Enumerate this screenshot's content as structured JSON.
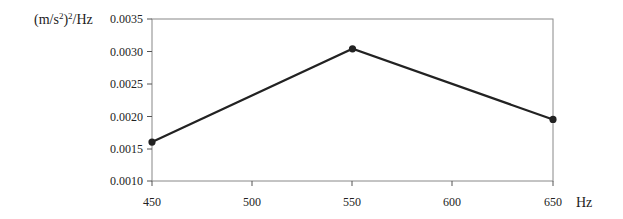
{
  "chart_data": {
    "type": "line",
    "title": "",
    "xlabel": "Hz",
    "ylabel": "(m/s²)²/Hz",
    "x": [
      450,
      550,
      650
    ],
    "series": [
      {
        "name": "PSD",
        "values": [
          0.0016,
          0.00304,
          0.00195
        ],
        "color": "#222222"
      }
    ],
    "xlim": [
      450,
      650
    ],
    "ylim": [
      0.001,
      0.0035
    ],
    "xticks": [
      "450",
      "500",
      "550",
      "600",
      "650"
    ],
    "yticks": [
      "0.0035",
      "0.0030",
      "0.0025",
      "0.0020",
      "0.0015",
      "0.0010"
    ],
    "grid": false,
    "legend": "none"
  },
  "labels": {
    "y_unit_base": "(m/s",
    "y_unit_sup1": "2",
    "y_unit_mid": ")",
    "y_unit_sup2": "2",
    "y_unit_tail": "/Hz",
    "x_unit": "Hz"
  }
}
